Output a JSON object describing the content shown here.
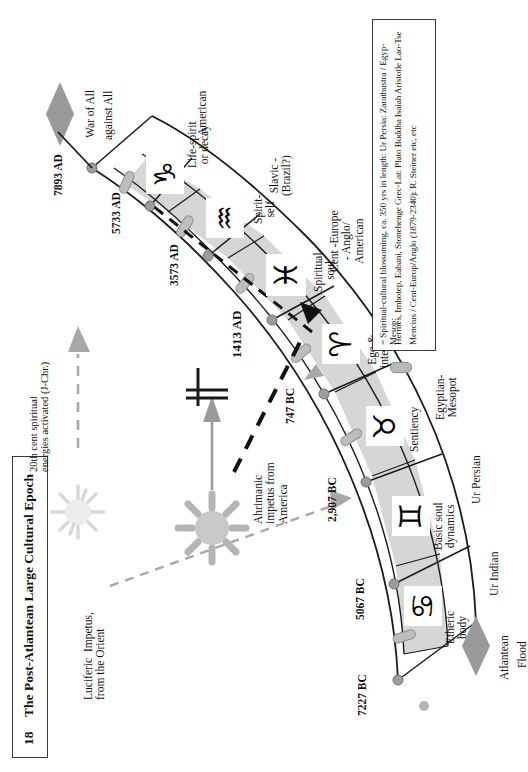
{
  "title": {
    "number": "18",
    "text": "The Post-Atlantean  Large Cultural Epoch"
  },
  "epochs": [
    {
      "id": "ur-indian",
      "culture": "Ur Indian",
      "inner": "Etheric\nbody",
      "sign": "cancer",
      "glyph": "♋",
      "start": "7227 BC",
      "end": "5067 BC"
    },
    {
      "id": "ur-persian",
      "culture": "Ur Persian",
      "inner": "Basic soul\ndynamics",
      "sign": "gemini",
      "glyph": "♊",
      "start": "5067 BC",
      "end": "2,907 BC"
    },
    {
      "id": "egypt-meso",
      "culture": "Egyptian-\nMesopot",
      "inner": "Sentiency",
      "sign": "taurus",
      "glyph": "♉",
      "start": "2,907 BC",
      "end": "747 BC"
    },
    {
      "id": "greco-latin",
      "culture": "Greco-Latin",
      "inner": "Ego &\nintellect",
      "sign": "aries",
      "glyph": "♈",
      "start": "747 BC",
      "end": "1413 AD"
    },
    {
      "id": "cent-europ",
      "culture": "Cent -Europe\n- Anglo/\nAmerican",
      "inner": "Spiritual-\nsoul",
      "sign": "pisces",
      "glyph": "♓",
      "start": "1413 AD",
      "end": "3573 AD"
    },
    {
      "id": "slavic",
      "culture": "Slavic -\n(Brazil?)",
      "inner": "Spirit-\nself",
      "sign": "aquarius",
      "glyph": "♒",
      "start": "3573 AD",
      "end": "5733 AD"
    },
    {
      "id": "american",
      "culture": "American",
      "inner": "Life-spirit\nor decay",
      "sign": "capricorn",
      "glyph": "♑",
      "start": "5733 AD",
      "end": "7893 AD"
    }
  ],
  "date_marks": [
    "7227 BC",
    "5067 BC",
    "2,907 BC",
    "747 BC",
    "1413 AD",
    "3573 AD",
    "5733 AD",
    "7893 AD"
  ],
  "annotations": {
    "luciferic": "Luciferic  Impetus,\nfrom the Orient",
    "ahrimanic": "Ahrimanic\nimpetus from\nAmerica",
    "twentieth_century": "20th cent spiritual\nenergies activated (J-Chr.)",
    "flood_top": "Atlantean",
    "flood_bottom": "Flood",
    "war_top": "War of All",
    "war_bottom": "against All"
  },
  "legend": {
    "line1": "= Spiritual-cultural blossoming, ca. 350 yrs in length: Ur Persia: Zarathustra / Egyp-Mesop:",
    "line2": "Hermes, Imhotep, Eabani, Stonehenge  Grec-Lat: Plato Buddha Isaiah Aristotle Lao-Tse",
    "line3": "Mencius / Cent-Europ/Anglo (1879-2340): R. Steiner etc, etc",
    "pill_label": "blossoming-pill"
  },
  "colors": {
    "band_fill": "#d6d6d6",
    "line": "#1a1a1a",
    "pill": "#b9b9b9",
    "sun_gold": "#b5b5b5",
    "arrow_gray": "#9a9a9a",
    "paper": "#ffffff"
  }
}
